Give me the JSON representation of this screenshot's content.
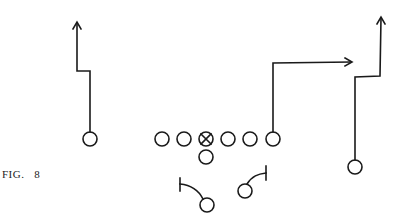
{
  "figure": {
    "caption": "FIG.   8",
    "stroke_color": "#1a1a1a"
  },
  "players": {
    "line": [
      {
        "id": "lineman-1",
        "x": 162,
        "y": 139,
        "type": "circle"
      },
      {
        "id": "lineman-2",
        "x": 184,
        "y": 139,
        "type": "circle"
      },
      {
        "id": "center",
        "x": 206,
        "y": 139,
        "type": "center-x"
      },
      {
        "id": "lineman-4",
        "x": 228,
        "y": 139,
        "type": "circle"
      },
      {
        "id": "lineman-5",
        "x": 250,
        "y": 139,
        "type": "circle"
      },
      {
        "id": "tight-end",
        "x": 273,
        "y": 139,
        "type": "circle"
      }
    ],
    "quarterback": {
      "x": 206,
      "y": 157
    },
    "left-receiver": {
      "x": 90,
      "y": 139
    },
    "right-receiver": {
      "x": 355,
      "y": 167
    },
    "left-back": {
      "x": 207,
      "y": 205
    },
    "right-back": {
      "x": 245,
      "y": 191
    }
  }
}
